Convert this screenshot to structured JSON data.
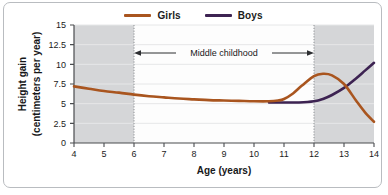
{
  "chart_data": {
    "type": "line",
    "title": "",
    "xlabel": "Age (years)",
    "ylabel_line1": "Height gain",
    "ylabel_line2": "(centimeters per year)",
    "xlim": [
      4,
      14
    ],
    "ylim": [
      0,
      15
    ],
    "xticks": [
      "4",
      "5",
      "6",
      "7",
      "8",
      "9",
      "10",
      "11",
      "12",
      "13",
      "14"
    ],
    "yticks": [
      "0",
      "2.5",
      "5",
      "7.5",
      "10",
      "12.5",
      "15"
    ],
    "grid": "horizontal",
    "legend_position": "top-center",
    "annotation": {
      "text": "Middle childhood",
      "x_start": 6,
      "x_end": 12,
      "y": 11.6,
      "arrows": "double"
    },
    "shaded_regions": [
      {
        "x_start": 4,
        "x_end": 6,
        "color": "#d5d6d8"
      },
      {
        "x_start": 12,
        "x_end": 14,
        "color": "#d5d6d8"
      }
    ],
    "colors": {
      "girls": "#a9551f",
      "boys": "#3d2352",
      "shading": "#d5d6d8",
      "frame": "#b9bcc0",
      "grid": "#e3e4e6",
      "axis": "#4a4c4f"
    },
    "series": [
      {
        "name": "Girls",
        "color": "#a9551f",
        "x": [
          4,
          4.5,
          5,
          5.5,
          6,
          6.5,
          7,
          7.5,
          8,
          8.5,
          9,
          9.5,
          10,
          10.5,
          10.8,
          11,
          11.3,
          11.6,
          12,
          12.3,
          12.6,
          13,
          13.4,
          13.7,
          14
        ],
        "values": [
          7.2,
          6.9,
          6.6,
          6.4,
          6.15,
          5.95,
          5.8,
          5.65,
          5.55,
          5.45,
          5.4,
          5.35,
          5.3,
          5.3,
          5.4,
          5.6,
          6.3,
          7.3,
          8.5,
          8.8,
          8.6,
          7.5,
          5.4,
          3.9,
          2.7
        ]
      },
      {
        "name": "Boys",
        "color": "#3d2352",
        "x": [
          10.5,
          11,
          11.5,
          12,
          12.3,
          12.6,
          13,
          13.4,
          13.7,
          14
        ],
        "values": [
          5.15,
          5.15,
          5.15,
          5.3,
          5.6,
          6.1,
          7.0,
          8.2,
          9.2,
          10.2
        ]
      }
    ]
  }
}
